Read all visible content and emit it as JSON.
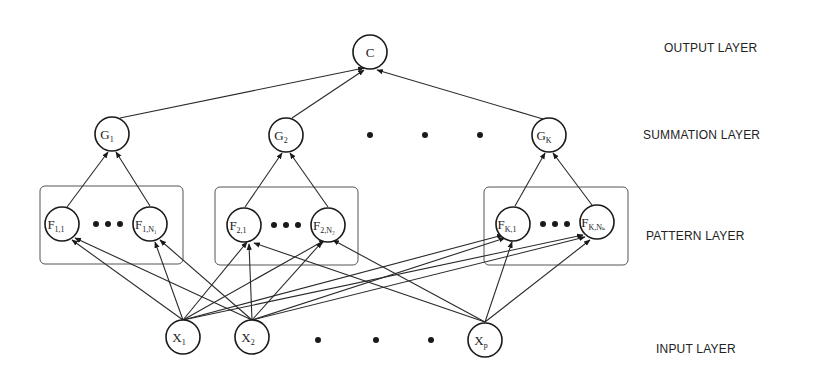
{
  "layers": {
    "output": "OUTPUT LAYER",
    "summation": "SUMMATION LAYER",
    "pattern": "PATTERN LAYER",
    "input": "INPUT LAYER"
  },
  "nodes": {
    "output": {
      "label": "C"
    },
    "summation": [
      {
        "main": "G",
        "sub": "1"
      },
      {
        "main": "G",
        "sub": "2"
      },
      {
        "main": "G",
        "sub": "K"
      }
    ],
    "pattern": [
      {
        "main": "F",
        "sub": "1,1"
      },
      {
        "main": "F",
        "sub": "1,N₁"
      },
      {
        "main": "F",
        "sub": "2,1"
      },
      {
        "main": "F",
        "sub": "2,N₂"
      },
      {
        "main": "F",
        "sub": "K,1"
      },
      {
        "main": "F",
        "sub": "K,Nₖ"
      }
    ],
    "input": [
      {
        "main": "X",
        "sub": "1"
      },
      {
        "main": "X",
        "sub": "2"
      },
      {
        "main": "X",
        "sub": "p"
      }
    ]
  },
  "colors": {
    "stroke": "#1a1a1a",
    "box": "#555555",
    "background": "#ffffff"
  }
}
